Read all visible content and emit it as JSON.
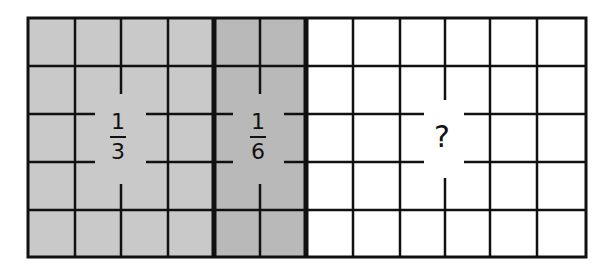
{
  "diagram": {
    "grid": {
      "columns": 12,
      "rows": 5
    },
    "colors": {
      "third_fill": "#c9c9c9",
      "sixth_fill": "#b9b9b9",
      "unknown_fill": "#ffffff",
      "line": "#111111"
    },
    "sections": [
      {
        "id": "third",
        "columns": 4,
        "label_numerator": "1",
        "label_denominator": "3"
      },
      {
        "id": "sixth",
        "columns": 2,
        "label_numerator": "1",
        "label_denominator": "6"
      },
      {
        "id": "unknown",
        "columns": 6,
        "label": "?"
      }
    ]
  }
}
